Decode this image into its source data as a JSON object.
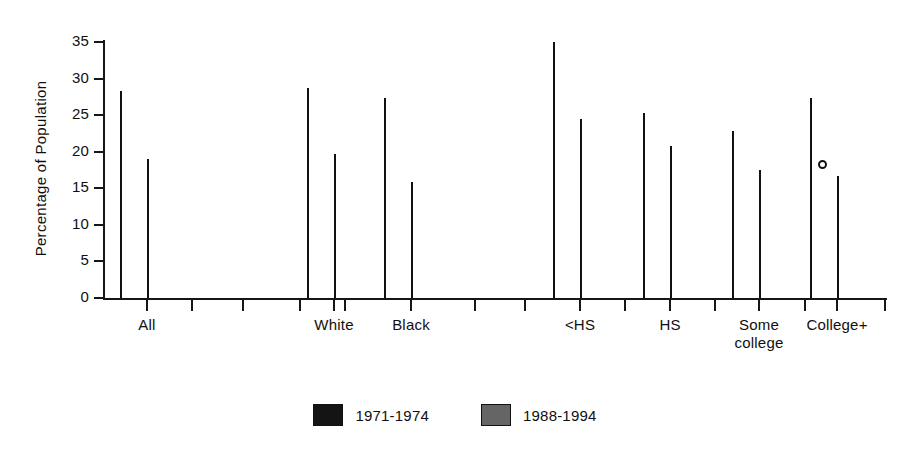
{
  "chart_data": {
    "type": "bar",
    "title": "",
    "xlabel": "",
    "ylabel": "Percentage of Population",
    "ylim": [
      0,
      35
    ],
    "ytick_values": [
      0,
      5,
      10,
      15,
      20,
      25,
      30,
      35
    ],
    "ytick_labels": [
      "0",
      "5",
      "10",
      "15",
      "20",
      "25",
      "30",
      "35"
    ],
    "grid": false,
    "legend_position": "bottom-center",
    "categories": [
      "All",
      "White",
      "Black",
      "<HS",
      "HS",
      "Some college",
      "College+"
    ],
    "category_label_lines": [
      [
        "All"
      ],
      [
        "White"
      ],
      [
        "Black"
      ],
      [
        "<HS"
      ],
      [
        "HS"
      ],
      [
        "Some",
        "college"
      ],
      [
        "College+"
      ]
    ],
    "series": [
      {
        "name": "1971-1974",
        "color": "#141414",
        "values": [
          28.3,
          28.7,
          27.4,
          35.0,
          25.3,
          22.9,
          27.3
        ]
      },
      {
        "name": "1988-1994",
        "color": "#656565",
        "values": [
          19.0,
          19.7,
          15.8,
          24.5,
          20.8,
          17.5,
          16.7
        ]
      }
    ],
    "annotations": [
      {
        "name": "scan-artifact-dot",
        "description": "small white dot on College+ 1971-1974 bar",
        "x_px": 818,
        "y_px": 160
      }
    ]
  },
  "legend": {
    "items": [
      {
        "label": "1971-1974",
        "swatch": "black"
      },
      {
        "label": "1988-1994",
        "swatch": "gray"
      }
    ]
  },
  "layout": {
    "axis_color": "#161616",
    "background": "#ffffff",
    "plot_left_px": 104,
    "plot_baseline_px": 298,
    "plot_top_px": 42,
    "px_per_unit": 7.314,
    "bar_width_px": 27,
    "group_centers_px": [
      147,
      334,
      411,
      580,
      670,
      759,
      837
    ],
    "extra_xtick_px": [
      192,
      243,
      300,
      345,
      475,
      525,
      625,
      715,
      805,
      885
    ]
  }
}
